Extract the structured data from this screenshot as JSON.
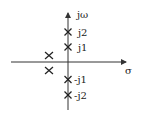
{
  "diagram": {
    "type": "pole-zero plot (s-plane)",
    "axes": {
      "vertical_label": "jω",
      "horizontal_label": "σ"
    },
    "imag_axis_labels": [
      "j2",
      "j1",
      "-j1",
      "-j2"
    ],
    "poles": [
      {
        "position": "on jω axis",
        "label": "j2"
      },
      {
        "position": "on jω axis",
        "label": "j1"
      },
      {
        "position": "on jω axis",
        "label": "-j1"
      },
      {
        "position": "on jω axis",
        "label": "-j2"
      },
      {
        "position": "left half-plane, above real axis",
        "label": ""
      },
      {
        "position": "left half-plane, below real axis",
        "label": ""
      }
    ]
  }
}
